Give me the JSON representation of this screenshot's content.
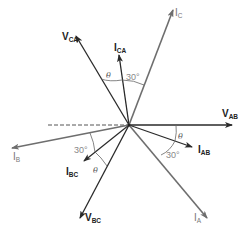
{
  "diagram": {
    "type": "phasor-diagram",
    "origin": [
      129,
      125
    ],
    "phasors": [
      {
        "id": "V_AB",
        "main": "V",
        "sub": "AB",
        "kind": "voltage",
        "tip": [
          232,
          125
        ],
        "label_pos": [
          222,
          117
        ]
      },
      {
        "id": "V_BC",
        "main": "V",
        "sub": "BC",
        "kind": "voltage",
        "tip": [
          80,
          218
        ],
        "label_pos": [
          85,
          221
        ]
      },
      {
        "id": "V_CA",
        "main": "V",
        "sub": "CA",
        "kind": "voltage",
        "tip": [
          76,
          36
        ],
        "label_pos": [
          62,
          40
        ]
      },
      {
        "id": "I_AB",
        "main": "I",
        "sub": "AB",
        "kind": "phase-current",
        "tip": [
          192,
          147
        ],
        "label_pos": [
          198,
          153
        ]
      },
      {
        "id": "I_BC",
        "main": "I",
        "sub": "BC",
        "kind": "phase-current",
        "tip": [
          84,
          161
        ],
        "label_pos": [
          66,
          175
        ]
      },
      {
        "id": "I_CA",
        "main": "I",
        "sub": "CA",
        "kind": "phase-current",
        "tip": [
          119,
          55
        ],
        "label_pos": [
          114,
          51
        ]
      },
      {
        "id": "I_A",
        "main": "I",
        "sub": "A",
        "kind": "line-current",
        "tip": [
          207,
          218
        ],
        "label_pos": [
          194,
          221
        ]
      },
      {
        "id": "I_B",
        "main": "I",
        "sub": "B",
        "kind": "line-current",
        "tip": [
          12,
          148
        ],
        "label_pos": [
          13,
          160
        ]
      },
      {
        "id": "I_C",
        "main": "I",
        "sub": "C",
        "kind": "line-current",
        "tip": [
          173,
          10
        ],
        "label_pos": [
          175,
          16
        ]
      }
    ],
    "reference_line": {
      "from": [
        48,
        125
      ],
      "to": [
        129,
        125
      ],
      "style": "dashed"
    },
    "angle_labels": {
      "theta": "θ",
      "thirty": "30°"
    },
    "angles": [
      {
        "between": [
          "V_CA",
          "I_CA"
        ],
        "label": "θ",
        "label_pos": [
          108,
          78
        ]
      },
      {
        "between": [
          "I_CA",
          "I_C"
        ],
        "label": "30°",
        "label_pos": [
          127,
          80
        ]
      },
      {
        "between": [
          "V_AB",
          "I_AB"
        ],
        "label": "θ",
        "label_pos": [
          179,
          139
        ]
      },
      {
        "between": [
          "I_AB",
          "I_A"
        ],
        "label": "30°",
        "label_pos": [
          167,
          158
        ]
      },
      {
        "between": [
          "I_B",
          "I_BC"
        ],
        "label": "30°",
        "label_pos": [
          75,
          153
        ]
      },
      {
        "between": [
          "I_BC",
          "V_BC"
        ],
        "label": "θ",
        "label_pos": [
          93,
          173
        ]
      }
    ]
  }
}
